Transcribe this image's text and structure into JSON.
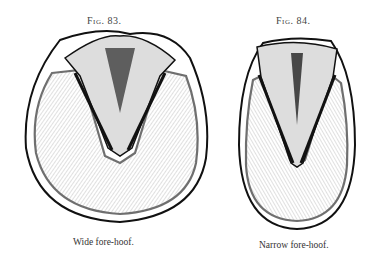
{
  "figures": [
    {
      "label": "Fig. 83.",
      "caption": "Wide fore-hoof."
    },
    {
      "label": "Fig. 84.",
      "caption": "Narrow fore-hoof."
    }
  ]
}
